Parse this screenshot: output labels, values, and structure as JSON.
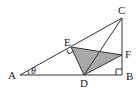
{
  "figure": {
    "type": "geometry",
    "shading_color": "#a9a9a9",
    "line_color": "#333333",
    "points": [
      {
        "id": "A",
        "label": "A"
      },
      {
        "id": "B",
        "label": "B"
      },
      {
        "id": "C",
        "label": "C"
      },
      {
        "id": "D",
        "label": "D"
      },
      {
        "id": "E",
        "label": "E"
      },
      {
        "id": "F",
        "label": "F"
      }
    ],
    "segments": [
      [
        "A",
        "B"
      ],
      [
        "B",
        "C"
      ],
      [
        "A",
        "C"
      ],
      [
        "D",
        "E"
      ],
      [
        "E",
        "F"
      ],
      [
        "F",
        "D"
      ],
      [
        "D",
        "C"
      ]
    ],
    "shaded_polygon": [
      "D",
      "E",
      "F"
    ],
    "right_angles": [
      "B",
      "E"
    ],
    "angle_label": {
      "vertex": "A",
      "text": "θ"
    }
  }
}
